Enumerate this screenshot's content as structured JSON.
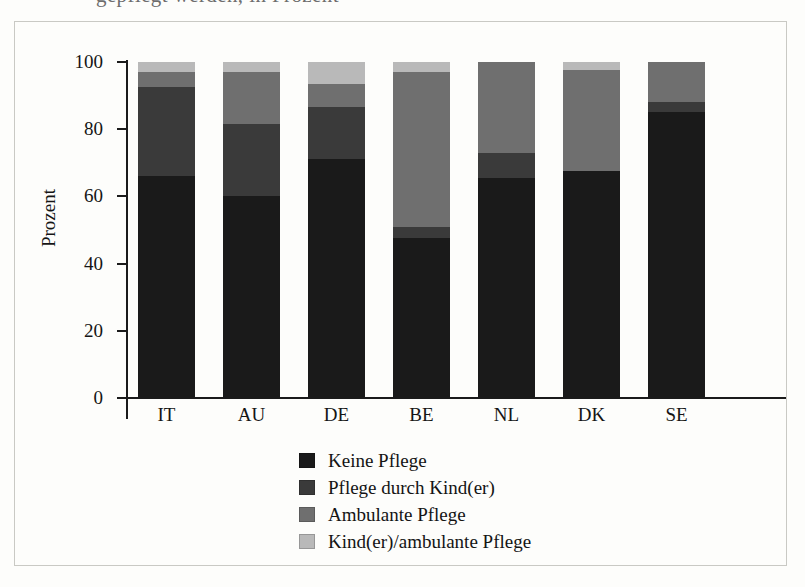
{
  "figure": {
    "top_bleed_text": "gepflegt werden, in Prozent"
  },
  "chart_data": {
    "type": "bar",
    "stacked": true,
    "title": "",
    "xlabel": "",
    "ylabel": "Prozent",
    "ylim": [
      0,
      100
    ],
    "yticks": [
      0,
      20,
      40,
      60,
      80,
      100
    ],
    "grid": false,
    "legend_position": "bottom",
    "categories": [
      "IT",
      "AU",
      "DE",
      "BE",
      "NL",
      "DK",
      "SE"
    ],
    "series": [
      {
        "name": "Keine Pflege",
        "color": "#1a1a1a",
        "values": [
          66,
          60,
          71,
          47.5,
          65.5,
          67.5,
          85
        ]
      },
      {
        "name": "Pflege durch Kind(er)",
        "color": "#3a3a3a",
        "values": [
          26.5,
          21.5,
          15.5,
          3.5,
          7.5,
          0,
          3
        ]
      },
      {
        "name": "Ambulante Pflege",
        "color": "#6f6f6f",
        "values": [
          4.5,
          15.5,
          7,
          46,
          27,
          30,
          12
        ]
      },
      {
        "name": "Kind(er)/ambulante Pflege",
        "color": "#b9b9b9",
        "values": [
          3,
          3,
          6.5,
          3,
          0,
          2.5,
          0
        ]
      }
    ]
  }
}
